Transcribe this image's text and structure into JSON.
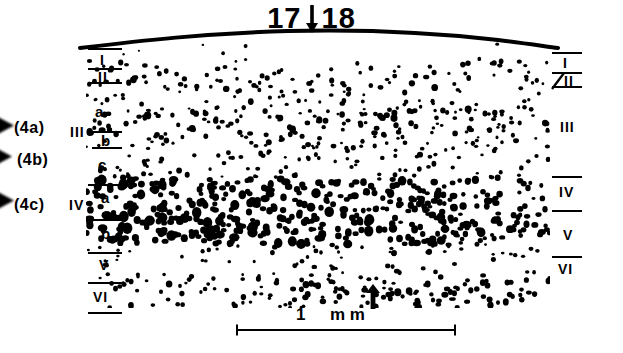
{
  "figure": {
    "type": "autoradiographic-dot-density-plot",
    "title": {
      "left_number": "17",
      "arrow": "down-arrow-icon",
      "right_number": "18"
    },
    "left_margin": {
      "callouts": [
        {
          "label": "(4a)",
          "marker": "arrowhead-icon"
        },
        {
          "label": "(4b)",
          "marker": "arrowhead-icon"
        },
        {
          "label": "(4c)",
          "marker": "arrowhead-icon"
        }
      ],
      "layers": [
        {
          "label": "I"
        },
        {
          "label": "II"
        },
        {
          "label": "III"
        },
        {
          "label": "IV"
        },
        {
          "label": "V"
        },
        {
          "label": "VI"
        }
      ],
      "sublayers": [
        {
          "label": "a"
        },
        {
          "label": "b"
        },
        {
          "label": "c"
        },
        {
          "label": "a"
        },
        {
          "label": "b"
        }
      ]
    },
    "right_margin": {
      "layers": [
        {
          "label": "I"
        },
        {
          "label": "II"
        },
        {
          "label": "III"
        },
        {
          "label": "IV"
        },
        {
          "label": "V"
        },
        {
          "label": "VI"
        }
      ]
    },
    "site_marker": {
      "icon": "up-arrow-icon"
    },
    "scale": {
      "value": "1",
      "unit": "m m"
    },
    "colors": {
      "ink": "#000000",
      "background": "#ffffff"
    }
  },
  "chart_data": {
    "type": "scatter",
    "title": "17↓18",
    "xlabel": "",
    "ylabel": "",
    "legend": [],
    "grid": false,
    "xlim": [
      0,
      464
    ],
    "ylim": [
      0,
      272
    ],
    "axis_units": {
      "x": "mm (scale bar = 1 mm)",
      "y": "cortical depth"
    },
    "scale_bar": {
      "label": "1 m m",
      "x_start": 237,
      "x_end": 455,
      "y": 330
    },
    "border_marker_x": 370,
    "layer_bands": [
      {
        "name": "I",
        "y_top": 0,
        "y_bottom": 22,
        "density": 0.06
      },
      {
        "name": "II",
        "y_top": 22,
        "y_bottom": 46,
        "density": 0.55
      },
      {
        "name": "IIIa",
        "y_top": 46,
        "y_bottom": 72,
        "density": 0.4
      },
      {
        "name": "IIIb",
        "y_top": 72,
        "y_bottom": 98,
        "density": 0.62
      },
      {
        "name": "IIIc",
        "y_top": 98,
        "y_bottom": 140,
        "density": 0.44
      },
      {
        "name": "IVa",
        "y_top": 140,
        "y_bottom": 172,
        "density": 0.88
      },
      {
        "name": "IVb",
        "y_top": 172,
        "y_bottom": 206,
        "density": 0.96
      },
      {
        "name": "V",
        "y_top": 206,
        "y_bottom": 238,
        "density": 0.32
      },
      {
        "name": "VI",
        "y_top": 238,
        "y_bottom": 272,
        "density": 0.58
      }
    ]
  }
}
